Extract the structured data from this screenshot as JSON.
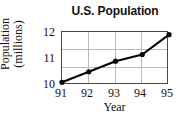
{
  "chart_data": {
    "type": "line",
    "title": "U.S. Population",
    "xlabel": "Year",
    "ylabel_line1": "Population",
    "ylabel_line2": "(millions)",
    "ylabel": "Population (millions)",
    "categories": [
      "91",
      "92",
      "93",
      "94",
      "95"
    ],
    "x": [
      91,
      92,
      93,
      94,
      95
    ],
    "values": [
      10.1,
      10.5,
      10.9,
      11.15,
      11.9
    ],
    "series": [
      {
        "name": "U.S. Population",
        "values": [
          10.1,
          10.5,
          10.9,
          11.15,
          11.9
        ]
      }
    ],
    "xlim": [
      91,
      95
    ],
    "ylim": [
      10,
      12
    ],
    "yticks": [
      "10",
      "11",
      "12"
    ],
    "ytick_values": [
      10,
      11,
      12
    ],
    "xticks": [
      "91",
      "92",
      "93",
      "94",
      "95"
    ],
    "grid": true,
    "legend": false,
    "marker": "filled-circle",
    "line_color": "#000000",
    "grid_color": "#b9b9b9",
    "axis_color": "#4a4a4a",
    "text_color": "#111111",
    "background_color": "#ffffff"
  }
}
